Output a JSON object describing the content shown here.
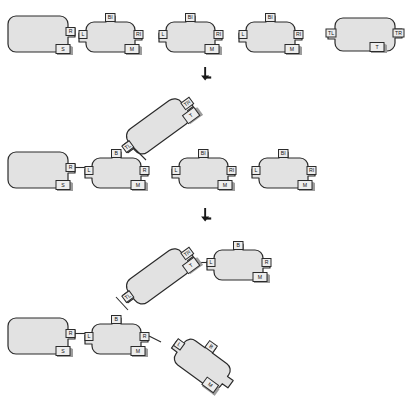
{
  "diagram": {
    "background_color": "#ffffff",
    "piece_fill": "#e2e2e2",
    "piece_stroke": "#2b2b2b",
    "tab_fill": "#ededed",
    "tab_shadow": "#9d9d9d",
    "arrow_glyph": "↓",
    "stages": [
      {
        "id": "stage-1",
        "name": "separate-pieces-row",
        "pieces": [
          {
            "id": "p1-1",
            "name": "root-piece",
            "tabs": [
              {
                "label": "R",
                "side": "right"
              },
              {
                "label": "S",
                "side": "bottom"
              }
            ]
          },
          {
            "id": "p1-2",
            "name": "branch-piece-a",
            "tabs": [
              {
                "label": "BI",
                "side": "top"
              },
              {
                "label": "L",
                "side": "left"
              },
              {
                "label": "RI",
                "side": "right"
              },
              {
                "label": "M",
                "side": "bottom"
              }
            ]
          },
          {
            "id": "p1-3",
            "name": "branch-piece-b",
            "tabs": [
              {
                "label": "BI",
                "side": "top"
              },
              {
                "label": "L",
                "side": "left"
              },
              {
                "label": "RI",
                "side": "right"
              },
              {
                "label": "M",
                "side": "bottom"
              }
            ]
          },
          {
            "id": "p1-4",
            "name": "branch-piece-c",
            "tabs": [
              {
                "label": "BI",
                "side": "top"
              },
              {
                "label": "L",
                "side": "left"
              },
              {
                "label": "RI",
                "side": "right"
              },
              {
                "label": "M",
                "side": "bottom"
              }
            ]
          },
          {
            "id": "p1-5",
            "name": "terminal-piece",
            "tabs": [
              {
                "label": "TL",
                "side": "left"
              },
              {
                "label": "TR",
                "side": "right"
              },
              {
                "label": "T",
                "side": "bottom"
              }
            ]
          }
        ]
      },
      {
        "id": "stage-2",
        "name": "partially-assembled-row",
        "pieces": [
          {
            "id": "p2-1",
            "name": "root-piece",
            "tabs": [
              {
                "label": "R",
                "side": "right"
              },
              {
                "label": "S",
                "side": "bottom"
              }
            ]
          },
          {
            "id": "p2-2",
            "name": "connected-branch-piece",
            "tabs": [
              {
                "label": "B",
                "side": "top"
              },
              {
                "label": "L",
                "side": "left"
              },
              {
                "label": "R",
                "side": "right"
              },
              {
                "label": "M",
                "side": "bottom"
              }
            ]
          },
          {
            "id": "p2-rot",
            "name": "rotated-attached-piece",
            "tabs": [
              {
                "label": "TL",
                "side": "lower-left"
              },
              {
                "label": "TR",
                "side": "upper-right"
              },
              {
                "label": "T",
                "side": "right"
              }
            ]
          },
          {
            "id": "p2-3",
            "name": "free-branch-piece-a",
            "tabs": [
              {
                "label": "BI",
                "side": "top"
              },
              {
                "label": "L",
                "side": "left"
              },
              {
                "label": "RI",
                "side": "right"
              },
              {
                "label": "M",
                "side": "bottom"
              }
            ]
          },
          {
            "id": "p2-4",
            "name": "free-branch-piece-b",
            "tabs": [
              {
                "label": "BI",
                "side": "top"
              },
              {
                "label": "L",
                "side": "left"
              },
              {
                "label": "RI",
                "side": "right"
              },
              {
                "label": "M",
                "side": "bottom"
              }
            ]
          }
        ],
        "connections": [
          {
            "from": "R",
            "to": "L"
          },
          {
            "from": "B",
            "to": "TL"
          }
        ]
      },
      {
        "id": "stage-3",
        "name": "fully-assembled-tree",
        "pieces": [
          {
            "id": "p3-1",
            "name": "root-piece",
            "tabs": [
              {
                "label": "R",
                "side": "right"
              },
              {
                "label": "S",
                "side": "bottom"
              }
            ]
          },
          {
            "id": "p3-2",
            "name": "hub-piece",
            "tabs": [
              {
                "label": "B",
                "side": "top"
              },
              {
                "label": "L",
                "side": "left"
              },
              {
                "label": "R",
                "side": "right"
              },
              {
                "label": "M",
                "side": "bottom"
              }
            ]
          },
          {
            "id": "p3-rot-up",
            "name": "rotated-upper-connector",
            "tabs": [
              {
                "label": "TL",
                "side": "lower-left"
              },
              {
                "label": "TR",
                "side": "upper-right"
              },
              {
                "label": "T",
                "side": "right"
              }
            ]
          },
          {
            "id": "p3-top",
            "name": "upper-right-leaf-piece",
            "tabs": [
              {
                "label": "B",
                "side": "top"
              },
              {
                "label": "L",
                "side": "left"
              },
              {
                "label": "R",
                "side": "right"
              },
              {
                "label": "M",
                "side": "bottom"
              }
            ]
          },
          {
            "id": "p3-rot-down",
            "name": "rotated-lower-leaf-piece",
            "tabs": [
              {
                "label": "L",
                "side": "upper-left"
              },
              {
                "label": "B",
                "side": "upper-right"
              },
              {
                "label": "M",
                "side": "bottom"
              }
            ]
          }
        ],
        "connections": [
          {
            "from": "R",
            "to": "L"
          },
          {
            "from": "B",
            "to": "TL"
          },
          {
            "from": "TR",
            "to": "L"
          },
          {
            "from": "R",
            "to": "L"
          }
        ]
      }
    ],
    "arrows": [
      {
        "id": "arrow-1",
        "name": "stage-1-to-stage-2-arrow"
      },
      {
        "id": "arrow-2",
        "name": "stage-2-to-stage-3-arrow"
      }
    ]
  }
}
